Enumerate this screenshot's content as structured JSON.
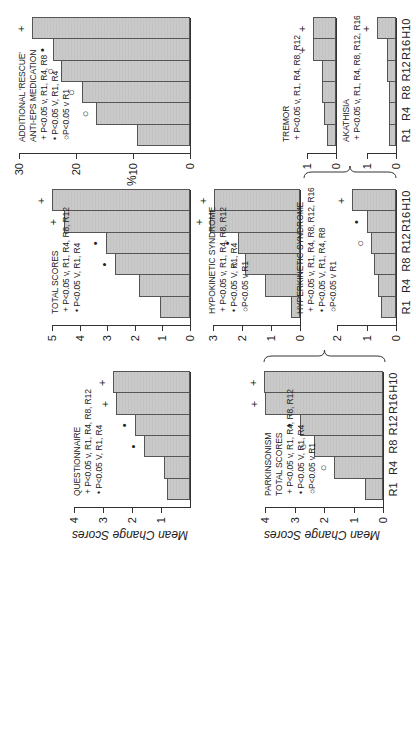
{
  "chart_data": [
    {
      "id": "questionnaire",
      "type": "bar",
      "title": "QUESTIONNAIRE",
      "legend": [
        "+ P<0.05 v, R1, R4, R8, R12",
        "• P<0.05 V, R1, R4"
      ],
      "categories": [
        "R1",
        "R4",
        "R8",
        "R12",
        "R16",
        "H10"
      ],
      "values": [
        0.8,
        0.9,
        1.6,
        1.9,
        2.55,
        2.65
      ],
      "markers": [
        "",
        "",
        "•",
        "•",
        "+",
        "+"
      ],
      "ylabel": "Mean Change Scores",
      "yticks": [
        1,
        2,
        3,
        4
      ],
      "ylim": [
        0,
        4
      ]
    },
    {
      "id": "parkinsonism",
      "type": "bar",
      "title": "PARKINSONISM",
      "subtitle": "TOTAL SCORES",
      "legend": [
        "+ P<0.05 v, R1, R4, R8, R12",
        "• P<0.05 V, R1, R4",
        "○P<0.05 v R1"
      ],
      "categories": [
        "R1",
        "R4",
        "R8",
        "R12",
        "R16",
        "H10"
      ],
      "values": [
        0.6,
        1.65,
        2.35,
        2.8,
        4.0,
        4.05
      ],
      "markers": [
        "",
        "○",
        "○",
        "•",
        "+",
        "+"
      ],
      "ylabel": "Mean Change Scores",
      "yticks": [
        0,
        1,
        2,
        3,
        4
      ],
      "ylim": [
        0,
        4
      ]
    },
    {
      "id": "total_scores",
      "type": "bar",
      "title": "TOTAL SCORES",
      "legend": [
        "+ P<0.05 v, R1, R4, R8, R12",
        "• P<0.05 V, R1, R4"
      ],
      "categories": [
        "R1",
        "R4",
        "R8",
        "R12",
        "R16",
        "H10"
      ],
      "values": [
        1.1,
        1.85,
        2.7,
        3.05,
        4.55,
        5.0
      ],
      "markers": [
        "",
        "",
        "•",
        "•",
        "+",
        "+"
      ],
      "ylabel": "",
      "yticks": [
        0,
        1,
        2,
        3,
        4,
        5
      ],
      "ylim": [
        0,
        5
      ]
    },
    {
      "id": "hypokinetic",
      "type": "bar",
      "title": "HYPOKINETIC SYNDROME",
      "legend": [
        "+ P<0.05 v, R1, R4, R8, R12",
        "• P<0.05 V, R1, R4",
        "○P<0.05 v R1"
      ],
      "categories": [
        "R1",
        "R4",
        "R8",
        "R12",
        "R16",
        "H10"
      ],
      "values": [
        0.3,
        1.2,
        1.9,
        2.15,
        3.1,
        2.95
      ],
      "markers": [
        "",
        "",
        "○",
        "•",
        "+",
        "+"
      ],
      "ylabel": "",
      "yticks": [
        0,
        1,
        2,
        3
      ],
      "ylim": [
        0,
        3
      ]
    },
    {
      "id": "hyperkinetic",
      "type": "bar",
      "title": "HYPERKINETIC SYNDROME",
      "legend": [
        "+ P<0.05 v, R1, R4, R8, R12, R16",
        "• P<0.05 V, R1, R4, R8",
        "○P<0.05 v R1"
      ],
      "categories": [
        "R1",
        "R4",
        "R8",
        "R12",
        "R16",
        "H10"
      ],
      "values": [
        0.5,
        0.6,
        0.75,
        0.85,
        1.0,
        1.5
      ],
      "markers": [
        "",
        "",
        "",
        "○",
        "•",
        "+"
      ],
      "ylabel": "",
      "yticks": [
        0,
        1,
        2
      ],
      "ylim": [
        0,
        2
      ]
    },
    {
      "id": "rescue",
      "type": "bar",
      "title": "ADDITIONAL 'RESCUE'",
      "subtitle": "ANTI-EPS MEDICATION",
      "legend": [
        "+ P<0.05 v, R1, R4, R8",
        "• P<0.05 V, R1, R4",
        "○P<0.05 v R1"
      ],
      "categories": [
        "R1",
        "R4",
        "R8",
        "R12",
        "R16",
        "H10"
      ],
      "values": [
        9.3,
        16.5,
        19.0,
        22.6,
        24.0,
        27.7
      ],
      "markers": [
        "",
        "○",
        "○",
        "○",
        "•",
        "+"
      ],
      "ylabel": "%",
      "yticks": [
        0,
        10,
        20,
        30
      ],
      "ylim": [
        0,
        30
      ]
    },
    {
      "id": "tremor",
      "type": "bar",
      "title": "TREMOR",
      "legend": [
        "+ P<0.05 v, R1, R4, R8, R12"
      ],
      "categories": [
        "R1",
        "R4",
        "R8",
        "R12",
        "R16",
        "H10"
      ],
      "values": [
        0.3,
        0.4,
        0.5,
        0.5,
        0.8,
        0.8
      ],
      "markers": [
        "",
        "",
        "",
        "",
        "+",
        "+"
      ],
      "ylabel": "",
      "yticks": [
        0,
        1
      ],
      "ylim": [
        0,
        1
      ]
    },
    {
      "id": "akathisia",
      "type": "bar",
      "title": "AKATHISIA",
      "legend": [
        "+ P<0.05 v, R1, R4, R8, R12, R16"
      ],
      "categories": [
        "R1",
        "R4",
        "R8",
        "R12",
        "R16",
        "H10"
      ],
      "values": [
        0.25,
        0.25,
        0.25,
        0.3,
        0.3,
        0.65
      ],
      "markers": [
        "",
        "",
        "",
        "",
        "",
        "+"
      ],
      "ylabel": "",
      "yticks": [
        0,
        1
      ],
      "ylim": [
        0,
        1
      ]
    }
  ],
  "layout": {
    "orientation": "figure rotated 90 degrees counterclockwise",
    "bar_color": "#c9c9c9",
    "bar_border": "#555555",
    "braces": [
      "parkinsonism groups hypokinetic and hyperkinetic",
      "hyperkinetic groups tremor and akathisia"
    ]
  }
}
